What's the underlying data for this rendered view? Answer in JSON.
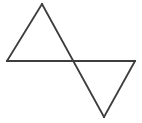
{
  "figure": {
    "background_color": "#ffffff",
    "stroke_color": "#3d3d3d",
    "stroke_width": 1.8,
    "canvas": {
      "width": 142,
      "height": 123
    },
    "points": {
      "left_base": {
        "x": 7,
        "y": 61,
        "label": "A"
      },
      "top_apex": {
        "x": 42,
        "y": 4,
        "label": "B"
      },
      "center_junction": {
        "x": 75,
        "y": 61,
        "label": "C"
      },
      "right_base": {
        "x": 135,
        "y": 61,
        "label": "D"
      },
      "bottom_apex": {
        "x": 104,
        "y": 117,
        "label": "E"
      }
    },
    "shapes": [
      {
        "name": "upper-left-triangle",
        "orientation": "points-up",
        "vertices": "7,61 42,4 75,61"
      },
      {
        "name": "lower-right-triangle",
        "orientation": "points-down",
        "vertices": "75,61 135,61 104,117"
      }
    ],
    "segments": [
      {
        "name": "baseline-horizontal",
        "x1": 7,
        "y1": 61,
        "x2": 135,
        "y2": 61
      },
      {
        "name": "upper-left-edge",
        "x1": 7,
        "y1": 61,
        "x2": 42,
        "y2": 4
      },
      {
        "name": "long-diagonal",
        "x1": 42,
        "y1": 4,
        "x2": 104,
        "y2": 117
      },
      {
        "name": "lower-right-edge",
        "x1": 104,
        "y1": 117,
        "x2": 135,
        "y2": 61
      }
    ]
  }
}
